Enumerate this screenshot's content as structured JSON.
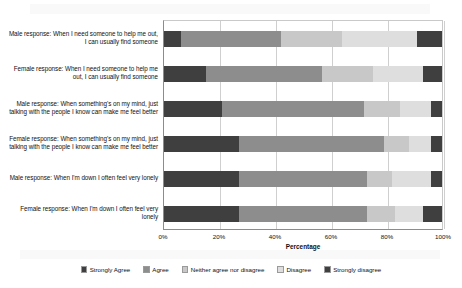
{
  "chart_data": {
    "type": "bar",
    "orientation": "horizontal",
    "stacked": true,
    "stacked_mode": "percent",
    "title": "",
    "xlabel": "Percentage",
    "ylabel": "",
    "xlim": [
      0,
      100
    ],
    "xticks": [
      "0%",
      "20%",
      "40%",
      "60%",
      "80%",
      "100%"
    ],
    "xtick_values": [
      0,
      20,
      40,
      60,
      80,
      100
    ],
    "grid": true,
    "grid_axis": "x",
    "legend_position": "bottom",
    "categories": [
      "Male response:  When I need someone to help me out, I can usually find someone",
      "Female response:  When I need someone to help me out, I can usually find someone",
      "Male response:  When something's on my mind, just talking with the people I know can make me feel better",
      "Female response:  When something's on my mind, just talking with the people I know can make me feel better",
      "Male response:  When I'm down I often feel very lonely",
      "Female response:  When I'm down I often feel very lonely"
    ],
    "series": [
      {
        "name": "Strongly Agree",
        "color": "#3f3f3f",
        "values": [
          6,
          15,
          21,
          27,
          27,
          27
        ]
      },
      {
        "name": "Agree",
        "color": "#8d8d8d",
        "values": [
          36,
          42,
          51,
          52,
          46,
          46
        ]
      },
      {
        "name": "Neither agree nor disagree",
        "color": "#c8c8c8",
        "values": [
          22,
          18,
          13,
          9,
          9,
          10
        ]
      },
      {
        "name": "Disagree",
        "color": "#dedede",
        "values": [
          27,
          18,
          11,
          8,
          14,
          10
        ]
      },
      {
        "name": "Strongly disagree",
        "color": "#3f3f3f",
        "values": [
          9,
          7,
          4,
          4,
          4,
          7
        ]
      }
    ]
  },
  "legend": {
    "items": [
      "Strongly Agree",
      "Agree",
      "Neither agree nor disagree",
      "Disagree",
      "Strongly disagree"
    ]
  },
  "axis": {
    "x_title": "Percentage"
  }
}
